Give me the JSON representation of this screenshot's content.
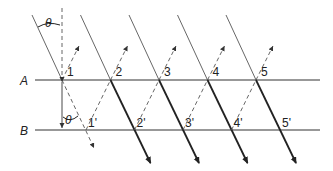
{
  "diagram": {
    "lines": [
      {
        "id": "A",
        "label": "A"
      },
      {
        "id": "B",
        "label": "B"
      }
    ],
    "points_A": [
      "1",
      "2",
      "3",
      "4",
      "5"
    ],
    "points_B": [
      "1'",
      "2'",
      "3'",
      "4'",
      "5'"
    ],
    "angle_label": "θ",
    "colors": {
      "ink": "#222222",
      "thin": "#555555",
      "dashed": "#666666"
    }
  }
}
